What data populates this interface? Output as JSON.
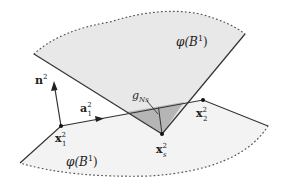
{
  "diagram": {
    "type": "contact-geometry-illustration",
    "colors": {
      "surface_fill": "#ebebeb",
      "gap_fill": "#b5b5b5",
      "line": "#333333",
      "dot": "#111111"
    },
    "labels": {
      "upper_surface": "φ(B",
      "upper_surface_sup": "1",
      "upper_surface_close": ")",
      "lower_surface": "φ(B",
      "lower_surface_sup": "1",
      "lower_surface_close": ")",
      "normal": "n",
      "normal_sup": "2",
      "tangent": "a",
      "tangent_sup": "2",
      "tangent_sub": "1",
      "node1": "x",
      "node1_sup": "2",
      "node1_sub": "1",
      "node2": "x",
      "node2_sup": "2",
      "node2_sub": "2",
      "slave": "x",
      "slave_sup": "2",
      "slave_sub": "s",
      "gap": "g",
      "gap_sub": "Ns"
    }
  }
}
